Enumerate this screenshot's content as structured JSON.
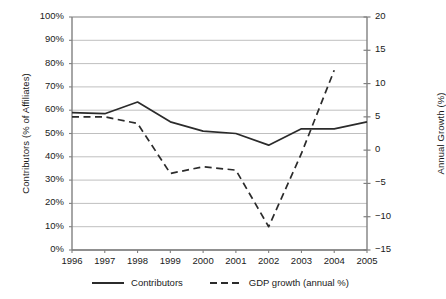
{
  "chart_data": {
    "type": "line",
    "title": "",
    "xlabel": "",
    "ylabel": "Contributors (% of Affiliates)",
    "y2label": "Annual Growth (%)",
    "grid": true,
    "legend_position": "bottom",
    "categories": [
      "1996",
      "1997",
      "1998",
      "1999",
      "2000",
      "2001",
      "2002",
      "2003",
      "2004",
      "2005"
    ],
    "x": [
      1996,
      1997,
      1998,
      1999,
      2000,
      2001,
      2002,
      2003,
      2004,
      2005
    ],
    "ylim": [
      0,
      100
    ],
    "y2lim": [
      -15,
      20
    ],
    "yticks": [
      "0%",
      "10%",
      "20%",
      "30%",
      "40%",
      "50%",
      "60%",
      "70%",
      "80%",
      "90%",
      "100%"
    ],
    "ytick_values": [
      0,
      10,
      20,
      30,
      40,
      50,
      60,
      70,
      80,
      90,
      100
    ],
    "y2ticks": [
      "-15",
      "-10",
      "-5",
      "0",
      "5",
      "10",
      "15",
      "20"
    ],
    "y2tick_values": [
      -15,
      -10,
      -5,
      0,
      5,
      10,
      15,
      20
    ],
    "series": [
      {
        "name": "Contributors",
        "axis": "left",
        "style": "solid",
        "color": "#2b2b2b",
        "values": [
          59,
          58.5,
          63.5,
          55,
          51,
          50,
          45,
          52,
          52,
          55
        ]
      },
      {
        "name": "GDP growth (annual %)",
        "axis": "right",
        "style": "dashed",
        "color": "#2b2b2b",
        "x": [
          1996,
          1997,
          1998,
          1999,
          2000,
          2001,
          2002,
          2003,
          2004
        ],
        "values": [
          5.0,
          5.0,
          4.0,
          -3.5,
          -2.5,
          -3.0,
          -11.5,
          -0.5,
          12.0
        ]
      }
    ]
  },
  "legend": {
    "items": [
      {
        "label": "Contributors",
        "style": "solid"
      },
      {
        "label": "GDP growth (annual %)",
        "style": "dashed"
      }
    ]
  },
  "axes": {
    "left_title": "Contributors (% of Affiliates)",
    "right_title": "Annual Growth (%)"
  },
  "colors": {
    "line": "#2b2b2b",
    "grid": "#b8b8b8",
    "axis": "#808080",
    "background": "#ffffff"
  }
}
